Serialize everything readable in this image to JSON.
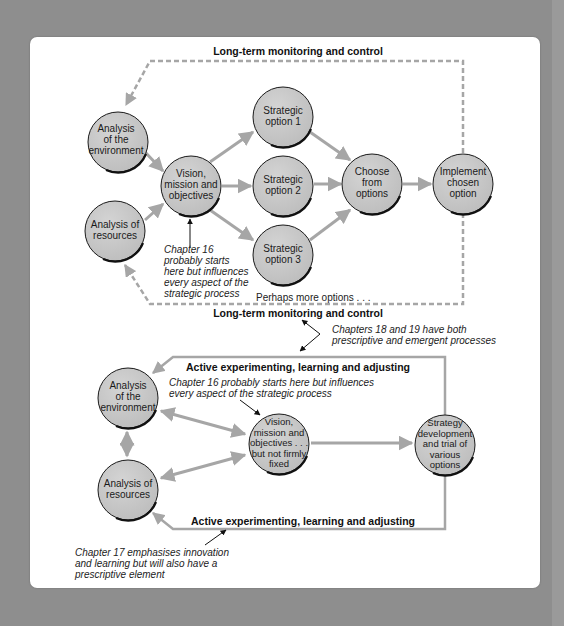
{
  "colors": {
    "background": "#8e8e8e",
    "panel": "#ffffff",
    "node_fill": "#c8c8c8",
    "node_stroke": "#1a1a1a",
    "arrow": "#a6a6a6",
    "dashed": "#a6a6a6",
    "annotation_arrow": "#111111"
  },
  "top_diagram": {
    "title_top": "Long-term monitoring and control",
    "title_bottom": "Long-term monitoring and control",
    "nodes": {
      "env": [
        "Analysis",
        "of the",
        "environment"
      ],
      "res": [
        "Analysis of",
        "resources"
      ],
      "vision": [
        "Vision,",
        "mission and",
        "objectives"
      ],
      "opt1": [
        "Strategic",
        "option 1"
      ],
      "opt2": [
        "Strategic",
        "option 2"
      ],
      "opt3": [
        "Strategic",
        "option 3"
      ],
      "choose": [
        "Choose",
        "from",
        "options"
      ],
      "implement": [
        "Implement",
        "chosen",
        "option"
      ]
    },
    "note_ch16": [
      "Chapter 16",
      "probably starts",
      "here but influences",
      "every aspect of the",
      "strategic process"
    ],
    "more_options": "Perhaps more options . . ."
  },
  "middle_note": [
    "Chapters 18 and 19 have both",
    "prescriptive and emergent processes"
  ],
  "bottom_diagram": {
    "title_top": "Active experimenting, learning and adjusting",
    "title_bottom": "Active experimenting, learning and adjusting",
    "note_ch16": [
      "Chapter 16 probably starts here but influences",
      "every aspect of the strategic process"
    ],
    "nodes": {
      "env": [
        "Analysis",
        "of the",
        "environment"
      ],
      "res": [
        "Analysis of",
        "resources"
      ],
      "vision": [
        "Vision,",
        "mission and",
        "objectives . . .",
        "but not firmly",
        "fixed"
      ],
      "strategy": [
        "Strategy",
        "development",
        "and trial of",
        "various",
        "options"
      ]
    },
    "note_ch17": [
      "Chapter 17 emphasises innovation",
      "and learning but will also have a",
      "prescriptive element"
    ]
  }
}
